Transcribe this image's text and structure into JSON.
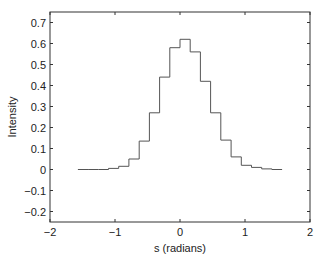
{
  "chart_data": {
    "type": "line",
    "style": "stairs-histogram",
    "title": "",
    "xlabel": "s (radians)",
    "ylabel": "Intensity",
    "xlim": [
      -2,
      2
    ],
    "ylim": [
      -0.25,
      0.75
    ],
    "xticks": [
      -2,
      -1,
      0,
      1,
      2
    ],
    "xtick_labels": [
      "−2",
      "−1",
      "0",
      "1",
      "2"
    ],
    "yticks": [
      -0.2,
      -0.1,
      0,
      0.1,
      0.2,
      0.3,
      0.4,
      0.5,
      0.6,
      0.7
    ],
    "ytick_labels": [
      "−0.2",
      "−0.1",
      "0",
      "0.1",
      "0.2",
      "0.3",
      "0.4",
      "0.5",
      "0.6",
      "0.7"
    ],
    "grid": false,
    "legend": null,
    "bin_edges_range": [
      -1.5708,
      1.5708
    ],
    "bin_count": 20,
    "x": [
      -1.492,
      -1.335,
      -1.178,
      -1.021,
      -0.864,
      -0.707,
      -0.55,
      -0.393,
      -0.236,
      -0.079,
      0.079,
      0.236,
      0.393,
      0.55,
      0.707,
      0.864,
      1.021,
      1.178,
      1.335,
      1.492
    ],
    "values": [
      0.0,
      0.0,
      0.0,
      0.005,
      0.015,
      0.05,
      0.135,
      0.27,
      0.44,
      0.58,
      0.62,
      0.56,
      0.42,
      0.27,
      0.14,
      0.06,
      0.02,
      0.01,
      0.003,
      0.0
    ],
    "line_color": "#555555"
  }
}
